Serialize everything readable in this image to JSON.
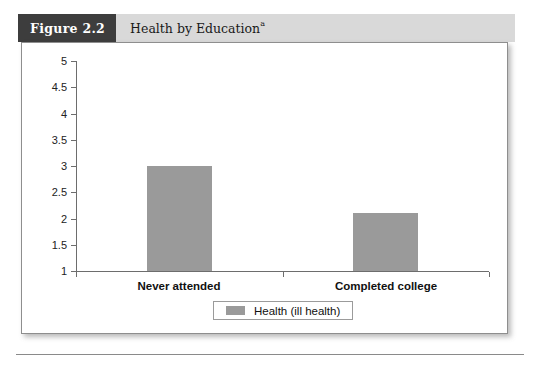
{
  "figure": {
    "number_label": "Figure 2.2",
    "title": "Health by Education",
    "title_superscript": "a"
  },
  "legend": {
    "entries": [
      {
        "label": "Health (ill health)",
        "color": "#9a9a9a"
      }
    ]
  },
  "colors": {
    "bar": "#9a9a9a",
    "header_band": "#d9d9d9",
    "number_box": "#3d3d3d",
    "axis": "#6d6d6d",
    "panel_border": "#8e8e8e"
  },
  "chart_data": {
    "type": "bar",
    "title": "Health by Education",
    "xlabel": "",
    "ylabel": "",
    "categories": [
      "Never attended",
      "Completed college"
    ],
    "values": [
      3.0,
      2.1
    ],
    "series": [
      {
        "name": "Health (ill health)",
        "values": [
          3.0,
          2.1
        ]
      }
    ],
    "ylim": [
      1,
      5
    ],
    "yticks": [
      1,
      1.5,
      2,
      2.5,
      3,
      3.5,
      4,
      4.5,
      5
    ],
    "ytick_labels": [
      "1",
      "1.5",
      "2",
      "2.5",
      "3",
      "3.5",
      "4",
      "4.5",
      "5"
    ],
    "grid": false,
    "legend_position": "bottom"
  }
}
